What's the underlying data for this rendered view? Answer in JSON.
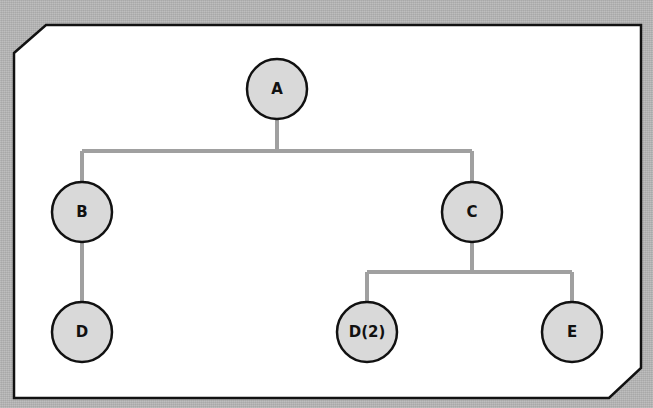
{
  "diagram": {
    "type": "tree",
    "colors": {
      "background": "#b4b4b4",
      "panel": "#ffffff",
      "panel_border": "#111111",
      "node_fill": "#d9d9d9",
      "node_border": "#111111",
      "edge": "#a0a0a0"
    },
    "nodes": [
      {
        "id": "A",
        "label": "A",
        "x": 277,
        "y": 89
      },
      {
        "id": "B",
        "label": "B",
        "x": 82,
        "y": 212
      },
      {
        "id": "C",
        "label": "C",
        "x": 472,
        "y": 212
      },
      {
        "id": "D",
        "label": "D",
        "x": 82,
        "y": 332
      },
      {
        "id": "D2",
        "label": "D(2)",
        "x": 367,
        "y": 332
      },
      {
        "id": "E",
        "label": "E",
        "x": 572,
        "y": 332
      }
    ],
    "edges": [
      {
        "from": "A",
        "to": "B"
      },
      {
        "from": "A",
        "to": "C"
      },
      {
        "from": "B",
        "to": "D"
      },
      {
        "from": "C",
        "to": "D2"
      },
      {
        "from": "C",
        "to": "E"
      }
    ]
  }
}
